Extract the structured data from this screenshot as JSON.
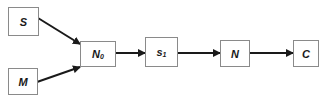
{
  "diagram": {
    "nodes": [
      {
        "id": "S",
        "label": "S",
        "sub": ""
      },
      {
        "id": "M",
        "label": "M",
        "sub": ""
      },
      {
        "id": "N0",
        "label": "N",
        "sub": "0"
      },
      {
        "id": "s1",
        "label": "s",
        "sub": "1"
      },
      {
        "id": "N",
        "label": "N",
        "sub": ""
      },
      {
        "id": "C",
        "label": "C",
        "sub": ""
      }
    ],
    "edges": [
      {
        "from": "S",
        "to": "N0"
      },
      {
        "from": "M",
        "to": "N0"
      },
      {
        "from": "N0",
        "to": "s1"
      },
      {
        "from": "s1",
        "to": "N"
      },
      {
        "from": "N",
        "to": "C"
      }
    ],
    "colors": {
      "edge": "#1a1a1a",
      "border": "#8a8a8a",
      "text": "#1a1a1a"
    }
  }
}
